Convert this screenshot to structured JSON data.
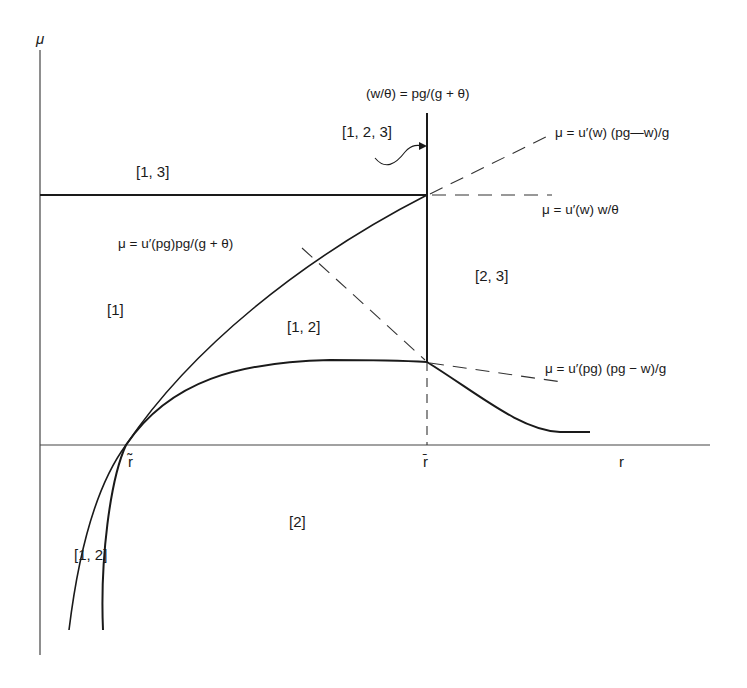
{
  "axes": {
    "y_label": "μ",
    "x_label": "r",
    "r_tilde": "r̃",
    "r_bar": "r̄"
  },
  "regions": {
    "r13": "[1, 3]",
    "r123": "[1, 2, 3]",
    "r1": "[1]",
    "r12_upper": "[1, 2]",
    "r23": "[2, 3]",
    "r2": "[2]",
    "r12_lower": "[1, 2]"
  },
  "equations": {
    "vertical_top": "(w/θ) = pg/(g + θ)",
    "upper_dashed": "μ = u′(w) (pg—w)/g",
    "horizontal_dashed": "μ = u′(w) w/θ",
    "rising_curve": "μ = u′(pg)pg/(g + θ)",
    "lower_dashed": "μ = u′(pg) (pg − w)/g"
  },
  "colors": {
    "ink": "#1a1a1a",
    "background": "#ffffff"
  }
}
